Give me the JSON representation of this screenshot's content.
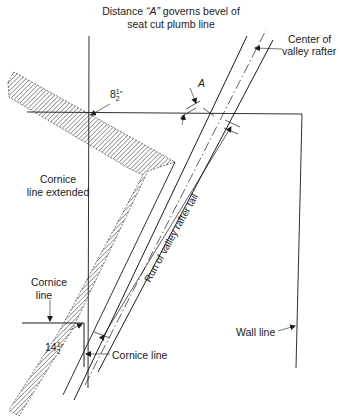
{
  "title": {
    "line1_pre": "Distance ",
    "line1_var": "“A”",
    "line1_post": " governs bevel of",
    "line2": "seat cut plumb line"
  },
  "labels": {
    "center_of_valley_rafter_1": "Center of",
    "center_of_valley_rafter_2": "valley rafter",
    "dimension_a": "A",
    "dim_upper_whole": "8",
    "dim_upper_num": "1",
    "dim_upper_den": "2",
    "dim_upper_unit": "″",
    "cornice_extended_1": "Cornice",
    "cornice_extended_2": "line extended",
    "run_label": "Run of valley rafter tail",
    "cornice_line_left_1": "Cornice",
    "cornice_line_left_2": "line",
    "dim_lower_whole": "14",
    "dim_lower_num": "1",
    "dim_lower_den": "2",
    "dim_lower_unit": "″",
    "cornice_line_bottom": "Cornice line",
    "wall_line": "Wall line"
  },
  "colors": {
    "line": "#1a1a1a",
    "hatch": "#333333",
    "background": "#ffffff"
  }
}
